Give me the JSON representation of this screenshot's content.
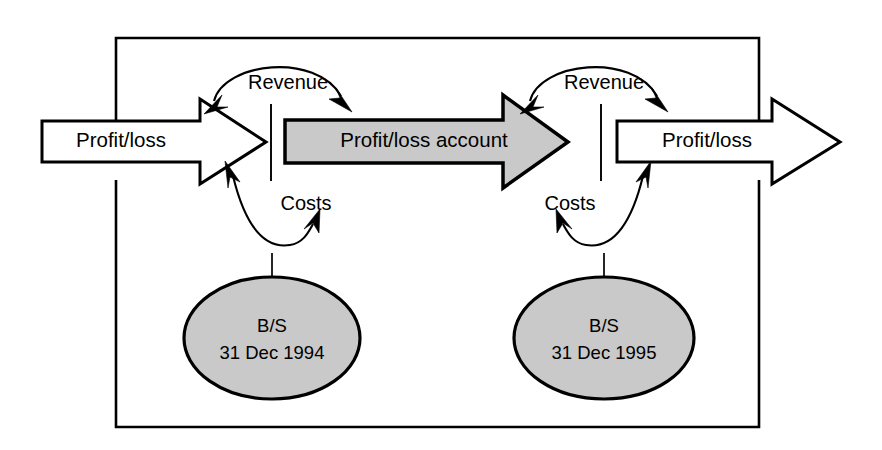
{
  "diagram": {
    "frame": {
      "name": "enclosing-box"
    },
    "flows": [
      {
        "id": "profit-loss-in",
        "label": "Profit/loss",
        "fill": "#ffffff",
        "position": "left"
      },
      {
        "id": "profit-loss-account",
        "label": "Profit/loss account",
        "fill": "#c9c9c9",
        "position": "center"
      },
      {
        "id": "profit-loss-out",
        "label": "Profit/loss",
        "fill": "#ffffff",
        "position": "right"
      }
    ],
    "connectors": [
      {
        "id": "revenue-left",
        "label": "Revenue",
        "position": "left-top"
      },
      {
        "id": "revenue-right",
        "label": "Revenue",
        "position": "right-top"
      },
      {
        "id": "costs-left",
        "label": "Costs",
        "position": "left-bottom"
      },
      {
        "id": "costs-right",
        "label": "Costs",
        "position": "right-bottom"
      }
    ],
    "nodes": [
      {
        "id": "balance-sheet-1994",
        "line1": "B/S",
        "line2": "31 Dec 1994",
        "fill": "#c9c9c9"
      },
      {
        "id": "balance-sheet-1995",
        "line1": "B/S",
        "line2": "31 Dec 1995",
        "fill": "#c9c9c9"
      }
    ],
    "colors": {
      "ink": "#000000",
      "paper": "#ffffff",
      "shade": "#c9c9c9"
    }
  }
}
